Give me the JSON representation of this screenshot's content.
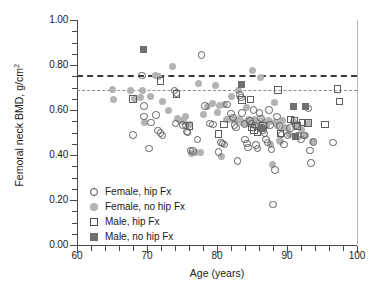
{
  "chart_data": {
    "type": "scatter",
    "title": "",
    "xlabel": "Age (years)",
    "ylabel": "Femoral neck BMD, g/cm²",
    "xlim": [
      60,
      100
    ],
    "ylim": [
      0.0,
      1.0
    ],
    "xticks": [
      60,
      70,
      80,
      90,
      100
    ],
    "xticklabels": [
      "60",
      "70",
      "80",
      "90",
      "100"
    ],
    "xtick_minor_step": 2,
    "yticks": [
      0.0,
      0.2,
      0.4,
      0.6,
      0.8,
      1.0
    ],
    "yticklabels": [
      "0.00",
      "0.20",
      "0.40",
      "0.60",
      "0.80",
      "1.00"
    ],
    "ytick_minor_step": 0.05,
    "grid": false,
    "legend_position": "lower-left-inside",
    "reference_lines": [
      {
        "name": "female-threshold",
        "orientation": "horizontal",
        "y": 0.755,
        "style": "dashed",
        "width": 2.1,
        "color": "#3a3a3a"
      },
      {
        "name": "male-threshold",
        "orientation": "horizontal",
        "y": 0.69,
        "style": "dashed",
        "width": 1.0,
        "color": "#8d8d8d"
      }
    ],
    "series": [
      {
        "name": "Female, hip Fx",
        "key": "fhf",
        "marker": "open-circle",
        "color": "#5d5d5d",
        "points": [
          [
            68.0,
            0.49
          ],
          [
            69.3,
            0.753
          ],
          [
            69.6,
            0.617
          ],
          [
            69.6,
            0.572
          ],
          [
            70.3,
            0.428
          ],
          [
            70.6,
            0.545
          ],
          [
            71.3,
            0.577
          ],
          [
            71.6,
            0.509
          ],
          [
            71.9,
            0.497
          ],
          [
            72.2,
            0.487
          ],
          [
            73.9,
            0.686
          ],
          [
            74.2,
            0.675
          ],
          [
            74.1,
            0.54
          ],
          [
            75.1,
            0.533
          ],
          [
            75.5,
            0.531
          ],
          [
            75.7,
            0.504
          ],
          [
            75.8,
            0.499
          ],
          [
            76.2,
            0.42
          ],
          [
            76.6,
            0.417
          ],
          [
            77.2,
            0.47
          ],
          [
            77.8,
            0.845
          ],
          [
            78.3,
            0.617
          ],
          [
            79.0,
            0.54
          ],
          [
            79.4,
            0.536
          ],
          [
            80.2,
            0.413
          ],
          [
            80.6,
            0.456
          ],
          [
            80.8,
            0.451
          ],
          [
            81.1,
            0.446
          ],
          [
            81.4,
            0.625
          ],
          [
            82.0,
            0.584
          ],
          [
            82.3,
            0.567
          ],
          [
            82.5,
            0.533
          ],
          [
            82.7,
            0.522
          ],
          [
            82.9,
            0.373
          ],
          [
            83.3,
            0.666
          ],
          [
            83.4,
            0.655
          ],
          [
            83.6,
            0.586
          ],
          [
            83.9,
            0.538
          ],
          [
            84.0,
            0.47
          ],
          [
            84.3,
            0.452
          ],
          [
            84.4,
            0.433
          ],
          [
            84.7,
            0.551
          ],
          [
            84.9,
            0.54
          ],
          [
            85.2,
            0.6
          ],
          [
            85.4,
            0.532
          ],
          [
            85.6,
            0.445
          ],
          [
            85.8,
            0.43
          ],
          [
            86.1,
            0.586
          ],
          [
            86.3,
            0.563
          ],
          [
            86.4,
            0.52
          ],
          [
            86.6,
            0.508
          ],
          [
            86.8,
            0.496
          ],
          [
            87.0,
            0.47
          ],
          [
            87.2,
            0.455
          ],
          [
            87.4,
            0.6
          ],
          [
            87.6,
            0.533
          ],
          [
            87.8,
            0.424
          ],
          [
            88.0,
            0.18
          ],
          [
            88.3,
            0.334
          ],
          [
            88.6,
            0.572
          ],
          [
            88.9,
            0.53
          ],
          [
            89.2,
            0.492
          ],
          [
            89.6,
            0.446
          ],
          [
            90.1,
            0.487
          ],
          [
            90.4,
            0.52
          ],
          [
            91.3,
            0.532
          ],
          [
            91.6,
            0.485
          ],
          [
            92.0,
            0.47
          ],
          [
            92.4,
            0.487
          ],
          [
            93.1,
            0.606
          ],
          [
            93.3,
            0.42
          ],
          [
            93.4,
            0.365
          ],
          [
            93.8,
            0.457
          ],
          [
            96.6,
            0.456
          ]
        ]
      },
      {
        "name": "Female, no hip Fx",
        "key": "fnf",
        "marker": "filled-circle",
        "color": "#b3b3b3",
        "points": [
          [
            65.0,
            0.692
          ],
          [
            65.2,
            0.645
          ],
          [
            67.6,
            0.688
          ],
          [
            68.2,
            0.65
          ],
          [
            69.0,
            0.655
          ],
          [
            69.4,
            0.688
          ],
          [
            69.7,
            0.545
          ],
          [
            70.5,
            0.66
          ],
          [
            71.2,
            0.752
          ],
          [
            71.6,
            0.748
          ],
          [
            72.2,
            0.637
          ],
          [
            73.0,
            0.6
          ],
          [
            73.6,
            0.795
          ],
          [
            74.3,
            0.564
          ],
          [
            74.8,
            0.553
          ],
          [
            75.2,
            0.548
          ],
          [
            75.5,
            0.571
          ],
          [
            76.0,
            0.537
          ],
          [
            76.4,
            0.408
          ],
          [
            76.9,
            0.411
          ],
          [
            77.4,
            0.72
          ],
          [
            77.6,
            0.412
          ],
          [
            78.1,
            0.582
          ],
          [
            78.6,
            0.616
          ],
          [
            79.4,
            0.628
          ],
          [
            79.8,
            0.711
          ],
          [
            80.0,
            0.587
          ],
          [
            80.3,
            0.62
          ],
          [
            80.7,
            0.392
          ],
          [
            81.0,
            0.625
          ],
          [
            81.3,
            0.557
          ],
          [
            81.6,
            0.556
          ],
          [
            82.0,
            0.66
          ],
          [
            82.3,
            0.556
          ],
          [
            82.6,
            0.553
          ],
          [
            83.0,
            0.688
          ],
          [
            83.2,
            0.56
          ],
          [
            83.5,
            0.551
          ],
          [
            83.7,
            0.546
          ],
          [
            84.0,
            0.54
          ],
          [
            84.2,
            0.612
          ],
          [
            84.5,
            0.558
          ],
          [
            84.7,
            0.545
          ],
          [
            84.9,
            0.536
          ],
          [
            85.1,
            0.775
          ],
          [
            85.2,
            0.553
          ],
          [
            85.4,
            0.56
          ],
          [
            85.6,
            0.548
          ],
          [
            85.8,
            0.54
          ],
          [
            86.0,
            0.536
          ],
          [
            86.2,
            0.745
          ],
          [
            86.3,
            0.552
          ],
          [
            86.5,
            0.546
          ],
          [
            86.7,
            0.541
          ],
          [
            86.9,
            0.535
          ],
          [
            87.1,
            0.53
          ],
          [
            87.3,
            0.555
          ],
          [
            87.5,
            0.549
          ],
          [
            87.7,
            0.448
          ],
          [
            87.9,
            0.357
          ],
          [
            88.2,
            0.634
          ],
          [
            88.4,
            0.546
          ],
          [
            88.6,
            0.529
          ],
          [
            88.9,
            0.466
          ],
          [
            89.1,
            0.458
          ],
          [
            89.4,
            0.555
          ],
          [
            89.7,
            0.524
          ],
          [
            90.0,
            0.516
          ],
          [
            90.3,
            0.493
          ],
          [
            90.9,
            0.548
          ],
          [
            91.4,
            0.536
          ],
          [
            92.0,
            0.512
          ],
          [
            92.6,
            0.485
          ],
          [
            93.0,
            0.538
          ],
          [
            93.6,
            0.46
          ]
        ]
      },
      {
        "name": "Male, hip Fx",
        "key": "mhf",
        "marker": "open-square",
        "color": "#5d5d5d",
        "points": [
          [
            68.0,
            0.648
          ],
          [
            71.9,
            0.728
          ],
          [
            74.2,
            0.672
          ],
          [
            76.1,
            0.53
          ],
          [
            80.2,
            0.494
          ],
          [
            81.0,
            0.536
          ],
          [
            83.6,
            0.644
          ],
          [
            84.8,
            0.646
          ],
          [
            85.0,
            0.522
          ],
          [
            85.3,
            0.509
          ],
          [
            85.8,
            0.499
          ],
          [
            86.6,
            0.529
          ],
          [
            88.7,
            0.688
          ],
          [
            89.1,
            0.496
          ],
          [
            90.5,
            0.558
          ],
          [
            91.1,
            0.553
          ],
          [
            91.5,
            0.53
          ],
          [
            92.2,
            0.545
          ],
          [
            93.0,
            0.543
          ],
          [
            95.4,
            0.535
          ],
          [
            97.2,
            0.693
          ],
          [
            97.5,
            0.637
          ]
        ]
      },
      {
        "name": "Male, no hip Fx",
        "key": "mnf",
        "marker": "filled-square",
        "color": "#6f6f6f",
        "points": [
          [
            69.5,
            0.87
          ],
          [
            83.5,
            0.712
          ],
          [
            86.3,
            0.516
          ],
          [
            90.9,
            0.617
          ],
          [
            91.2,
            0.483
          ],
          [
            92.7,
            0.615
          ]
        ]
      }
    ]
  },
  "axes": {
    "y_title": "Femoral neck BMD, g/cm",
    "y_title_sup": "2",
    "x_title": "Age (years)"
  },
  "legend": {
    "items": [
      {
        "key": "fhf",
        "label": "Female, hip Fx"
      },
      {
        "key": "fnf",
        "label": "Female, no hip Fx"
      },
      {
        "key": "mhf",
        "label": "Male, hip Fx"
      },
      {
        "key": "mnf",
        "label": "Male, no hip Fx"
      }
    ]
  }
}
